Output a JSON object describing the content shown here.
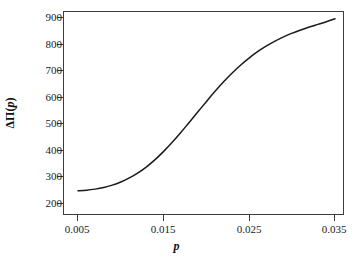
{
  "figure": {
    "top_remnant": "",
    "background_color": "#ffffff",
    "line_color": "#1a1a1a",
    "axis_color": "#3c3c3c"
  },
  "axes": {
    "ylabel_delta": "Δ",
    "ylabel_pi": "Π",
    "ylabel_open": "(",
    "ylabel_var": "p",
    "ylabel_close": ")",
    "xlabel": "p"
  },
  "chart_data": {
    "type": "line",
    "title": "",
    "xlabel": "p",
    "ylabel": "ΔΠ(p)",
    "xlim": [
      0.005,
      0.035
    ],
    "ylim": [
      200,
      900
    ],
    "grid": false,
    "legend": null,
    "xticks": [
      0.005,
      0.015,
      0.025,
      0.035
    ],
    "xtick_labels": [
      "0.005",
      "0.015",
      "0.025",
      "0.035"
    ],
    "yticks": [
      200,
      300,
      400,
      500,
      600,
      700,
      800,
      900
    ],
    "ytick_labels": [
      "200",
      "300",
      "400",
      "500",
      "600",
      "700",
      "800",
      "900"
    ],
    "series": [
      {
        "name": "ΔΠ(p)",
        "color": "#1a1a1a",
        "x": [
          0.005,
          0.006,
          0.007,
          0.008,
          0.009,
          0.01,
          0.011,
          0.012,
          0.013,
          0.014,
          0.015,
          0.016,
          0.017,
          0.018,
          0.019,
          0.02,
          0.021,
          0.022,
          0.023,
          0.024,
          0.025,
          0.026,
          0.027,
          0.028,
          0.029,
          0.03,
          0.031,
          0.032,
          0.033,
          0.034,
          0.035
        ],
        "y": [
          250,
          252,
          256,
          262,
          271,
          283,
          298,
          317,
          340,
          367,
          398,
          432,
          469,
          508,
          547,
          586,
          624,
          660,
          693,
          723,
          750,
          774,
          795,
          813,
          829,
          843,
          855,
          866,
          876,
          886,
          897
        ]
      }
    ]
  }
}
